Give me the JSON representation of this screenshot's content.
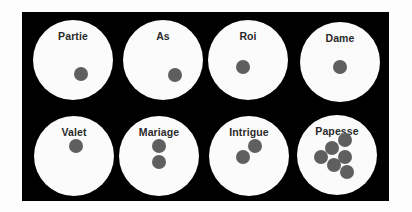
{
  "diagram": {
    "background": "#000000",
    "disc_color": "#fbfbfb",
    "dot_color": "#5f5f5f",
    "cells": [
      {
        "label": "Partie",
        "cx": 73,
        "cy": 60,
        "dots": [
          [
            81,
            74
          ]
        ]
      },
      {
        "label": "As",
        "cx": 163,
        "cy": 60,
        "dots": [
          [
            175,
            75
          ]
        ]
      },
      {
        "label": "Roi",
        "cx": 248,
        "cy": 60,
        "dots": [
          [
            243,
            67
          ]
        ]
      },
      {
        "label": "Dame",
        "cx": 340,
        "cy": 62,
        "dots": [
          [
            340,
            67
          ]
        ]
      },
      {
        "label": "Valet",
        "cx": 74,
        "cy": 156,
        "dots": [
          [
            76,
            146
          ]
        ]
      },
      {
        "label": "Mariage",
        "cx": 159,
        "cy": 156,
        "dots": [
          [
            159,
            146
          ],
          [
            159,
            162
          ]
        ]
      },
      {
        "label": "Intrigue",
        "cx": 249,
        "cy": 156,
        "dots": [
          [
            255,
            146
          ],
          [
            243,
            157
          ]
        ]
      },
      {
        "label": "Papesse",
        "cx": 337,
        "cy": 155,
        "dots": [
          [
            345,
            140
          ],
          [
            332,
            148
          ],
          [
            345,
            157
          ],
          [
            321,
            157
          ],
          [
            334,
            165
          ],
          [
            347,
            172
          ]
        ]
      }
    ]
  }
}
